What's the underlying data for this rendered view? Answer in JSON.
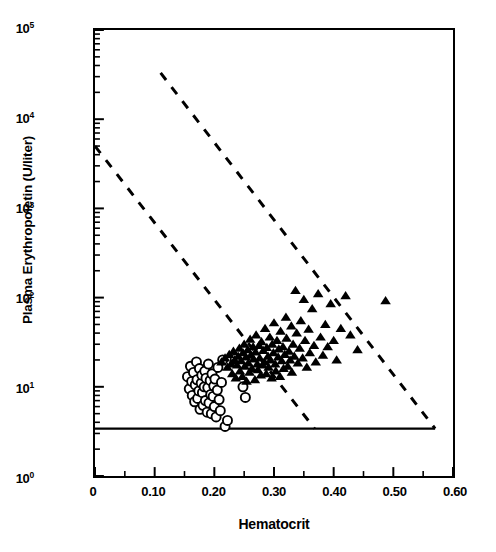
{
  "figure": {
    "background": "#ffffff",
    "marker_color": "#000000",
    "line_color": "#000000"
  },
  "axes": {
    "x_title": "Hematocrit",
    "y_title": "Plasma Erythropoietin (U/liter)",
    "x_ticks": [
      {
        "value": 0.0,
        "label": "0"
      },
      {
        "value": 0.1,
        "label": "0.10"
      },
      {
        "value": 0.2,
        "label": "0.20"
      },
      {
        "value": 0.3,
        "label": "0.30"
      },
      {
        "value": 0.4,
        "label": "0.40"
      },
      {
        "value": 0.5,
        "label": "0.50"
      },
      {
        "value": 0.6,
        "label": "0.60"
      }
    ],
    "x_minor_ticks": [
      0.05,
      0.15,
      0.25,
      0.35,
      0.45,
      0.55
    ],
    "y_ticks": [
      {
        "value": 1,
        "mantissa": "10",
        "exponent": "0"
      },
      {
        "value": 10,
        "mantissa": "10",
        "exponent": "1"
      },
      {
        "value": 100,
        "mantissa": "10",
        "exponent": "2"
      },
      {
        "value": 1000,
        "mantissa": "10",
        "exponent": "3"
      },
      {
        "value": 10000,
        "mantissa": "10",
        "exponent": "4"
      },
      {
        "value": 100000,
        "mantissa": "10",
        "exponent": "5"
      }
    ]
  },
  "chart_data": {
    "type": "scatter",
    "title": "",
    "xlabel": "Hematocrit",
    "ylabel": "Plasma Erythropoietin (U/liter)",
    "xlim": [
      0,
      0.6
    ],
    "ylim": [
      1,
      100000
    ],
    "yscale": "log",
    "xscale": "linear",
    "grid": false,
    "legend": "none",
    "series": [
      {
        "name": "open-circles",
        "marker": "circle-open",
        "count": 46,
        "points": [
          [
            0.155,
            13.0
          ],
          [
            0.158,
            9.5
          ],
          [
            0.16,
            17.0
          ],
          [
            0.162,
            11.5
          ],
          [
            0.163,
            8.0
          ],
          [
            0.165,
            14.5
          ],
          [
            0.167,
            6.8
          ],
          [
            0.168,
            10.5
          ],
          [
            0.17,
            19.0
          ],
          [
            0.171,
            12.0
          ],
          [
            0.172,
            7.4
          ],
          [
            0.174,
            9.0
          ],
          [
            0.175,
            16.0
          ],
          [
            0.176,
            5.6
          ],
          [
            0.178,
            11.0
          ],
          [
            0.179,
            13.5
          ],
          [
            0.18,
            8.6
          ],
          [
            0.181,
            6.2
          ],
          [
            0.183,
            10.0
          ],
          [
            0.184,
            15.0
          ],
          [
            0.185,
            7.0
          ],
          [
            0.186,
            12.5
          ],
          [
            0.188,
            5.2
          ],
          [
            0.189,
            9.8
          ],
          [
            0.19,
            18.0
          ],
          [
            0.191,
            6.6
          ],
          [
            0.193,
            11.8
          ],
          [
            0.194,
            8.2
          ],
          [
            0.195,
            5.0
          ],
          [
            0.196,
            14.0
          ],
          [
            0.198,
            7.8
          ],
          [
            0.199,
            10.2
          ],
          [
            0.2,
            6.0
          ],
          [
            0.201,
            12.2
          ],
          [
            0.203,
            4.6
          ],
          [
            0.205,
            9.2
          ],
          [
            0.206,
            16.5
          ],
          [
            0.208,
            7.2
          ],
          [
            0.21,
            5.4
          ],
          [
            0.212,
            11.2
          ],
          [
            0.214,
            20.0
          ],
          [
            0.218,
            3.6
          ],
          [
            0.222,
            4.2
          ],
          [
            0.235,
            20.5
          ],
          [
            0.248,
            10.0
          ],
          [
            0.252,
            7.6
          ]
        ]
      },
      {
        "name": "filled-triangles",
        "marker": "triangle-filled",
        "count": 98,
        "points": [
          [
            0.212,
            19.0
          ],
          [
            0.218,
            21.0
          ],
          [
            0.222,
            16.5
          ],
          [
            0.225,
            23.0
          ],
          [
            0.228,
            18.0
          ],
          [
            0.23,
            14.0
          ],
          [
            0.232,
            25.0
          ],
          [
            0.234,
            20.0
          ],
          [
            0.236,
            12.5
          ],
          [
            0.238,
            17.5
          ],
          [
            0.24,
            22.0
          ],
          [
            0.242,
            27.0
          ],
          [
            0.243,
            15.0
          ],
          [
            0.245,
            19.5
          ],
          [
            0.247,
            13.0
          ],
          [
            0.248,
            24.0
          ],
          [
            0.25,
            30.0
          ],
          [
            0.251,
            17.0
          ],
          [
            0.253,
            21.5
          ],
          [
            0.254,
            11.5
          ],
          [
            0.256,
            26.0
          ],
          [
            0.257,
            18.5
          ],
          [
            0.259,
            14.5
          ],
          [
            0.26,
            34.0
          ],
          [
            0.261,
            22.5
          ],
          [
            0.263,
            16.0
          ],
          [
            0.265,
            28.0
          ],
          [
            0.266,
            20.5
          ],
          [
            0.268,
            12.0
          ],
          [
            0.269,
            24.5
          ],
          [
            0.27,
            38.0
          ],
          [
            0.272,
            18.0
          ],
          [
            0.273,
            15.5
          ],
          [
            0.275,
            29.0
          ],
          [
            0.276,
            21.0
          ],
          [
            0.278,
            13.5
          ],
          [
            0.279,
            32.0
          ],
          [
            0.281,
            17.5
          ],
          [
            0.282,
            25.5
          ],
          [
            0.284,
            19.0
          ],
          [
            0.285,
            45.0
          ],
          [
            0.287,
            14.0
          ],
          [
            0.288,
            27.5
          ],
          [
            0.29,
            22.0
          ],
          [
            0.291,
            16.5
          ],
          [
            0.293,
            36.0
          ],
          [
            0.294,
            20.0
          ],
          [
            0.296,
            12.5
          ],
          [
            0.297,
            30.0
          ],
          [
            0.299,
            24.0
          ],
          [
            0.3,
            52.0
          ],
          [
            0.302,
            18.0
          ],
          [
            0.303,
            15.0
          ],
          [
            0.305,
            33.0
          ],
          [
            0.307,
            21.5
          ],
          [
            0.308,
            26.5
          ],
          [
            0.31,
            13.0
          ],
          [
            0.311,
            42.0
          ],
          [
            0.313,
            19.5
          ],
          [
            0.315,
            28.0
          ],
          [
            0.316,
            16.0
          ],
          [
            0.318,
            23.0
          ],
          [
            0.32,
            60.0
          ],
          [
            0.321,
            35.0
          ],
          [
            0.323,
            17.0
          ],
          [
            0.325,
            25.0
          ],
          [
            0.327,
            20.0
          ],
          [
            0.329,
            48.0
          ],
          [
            0.33,
            14.5
          ],
          [
            0.332,
            30.0
          ],
          [
            0.334,
            22.0
          ],
          [
            0.336,
            120.0
          ],
          [
            0.338,
            40.0
          ],
          [
            0.34,
            18.5
          ],
          [
            0.343,
            27.0
          ],
          [
            0.345,
            55.0
          ],
          [
            0.348,
            21.0
          ],
          [
            0.35,
            95.0
          ],
          [
            0.352,
            33.0
          ],
          [
            0.355,
            16.5
          ],
          [
            0.358,
            44.0
          ],
          [
            0.36,
            24.0
          ],
          [
            0.364,
            75.0
          ],
          [
            0.367,
            29.0
          ],
          [
            0.37,
            19.0
          ],
          [
            0.374,
            110.0
          ],
          [
            0.378,
            36.0
          ],
          [
            0.382,
            22.5
          ],
          [
            0.386,
            50.0
          ],
          [
            0.39,
            28.0
          ],
          [
            0.395,
            85.0
          ],
          [
            0.4,
            33.0
          ],
          [
            0.405,
            20.0
          ],
          [
            0.412,
            45.0
          ],
          [
            0.42,
            105.0
          ],
          [
            0.428,
            38.0
          ],
          [
            0.44,
            26.0
          ],
          [
            0.487,
            92.0
          ]
        ]
      }
    ],
    "reference_lines": [
      {
        "name": "detection-limit",
        "style": "solid",
        "orientation": "horizontal",
        "y": 3.4,
        "x_start": 0.0,
        "x_end": 0.57
      },
      {
        "name": "upper-regression-bound",
        "style": "dashed",
        "x_start": 0.11,
        "y_start": 33000,
        "x_end": 0.57,
        "y_end": 3.4
      },
      {
        "name": "lower-regression-bound",
        "style": "dashed",
        "x_start": 0.0,
        "y_start": 5000,
        "x_end": 0.368,
        "y_end": 3.4
      }
    ]
  }
}
